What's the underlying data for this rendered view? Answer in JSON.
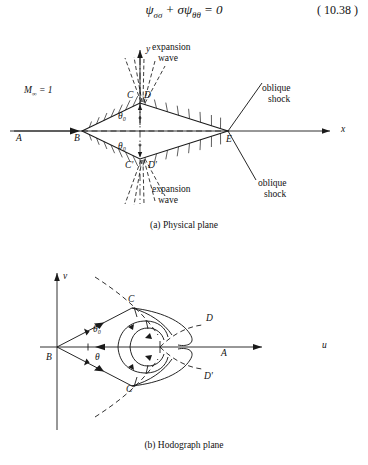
{
  "equation": {
    "body_html": "ψ<sub>σσ</sub> + σψ<sub>θθ</sub> = 0",
    "body_text": "ψσσ + σψθθ = 0",
    "number": "( 10.38 )"
  },
  "colors": {
    "ink": "#111111",
    "background": "#ffffff",
    "line": "#1a1a1a"
  },
  "physical_plane": {
    "caption": "(a)  Physical plane",
    "freestream_label_html": "M<sub>∞</sub> = 1",
    "freestream_label_text": "M∞ = 1",
    "axis_x_label": "x",
    "axis_y_label": "y",
    "points": {
      "A": "A",
      "B": "B",
      "C": "C",
      "D": "D",
      "E": "E",
      "C_prime": "C'",
      "D_prime": "D'"
    },
    "angle_upper": "θ₀",
    "angle_lower": "θ₀",
    "annotations": {
      "expansion_wave_upper_line1": "expansion",
      "expansion_wave_upper_line2": "wave",
      "expansion_wave_lower_line1": "expansion",
      "expansion_wave_lower_line2": "wave",
      "oblique_shock_upper_line1": "oblique",
      "oblique_shock_upper_line2": "shock",
      "oblique_shock_lower_line1": "oblique",
      "oblique_shock_lower_line2": "shock"
    }
  },
  "hodograph_plane": {
    "caption": "(b)  Hodograph   plane",
    "axis_u_label": "u",
    "axis_v_label": "v",
    "points": {
      "A": "A",
      "B": "B",
      "C": "C",
      "D": "D",
      "C_prime": "C'",
      "D_prime": "D'"
    },
    "angle_theta0": "θ₀",
    "angle_theta": "θ"
  }
}
